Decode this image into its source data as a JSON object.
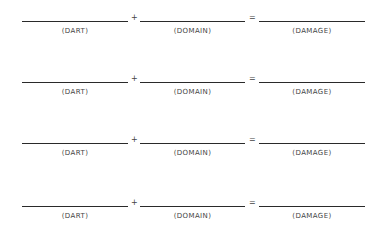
{
  "worksheet": {
    "rows": [
      {
        "term1_label": "(DART)",
        "operator1": "+",
        "term2_label": "(DOMAIN)",
        "operator2": "=",
        "result_label": "(DAMAGE)"
      },
      {
        "term1_label": "(DART)",
        "operator1": "+",
        "term2_label": "(DOMAIN)",
        "operator2": "=",
        "result_label": "(DAMAGE)"
      },
      {
        "term1_label": "(DART)",
        "operator1": "+",
        "term2_label": "(DOMAIN)",
        "operator2": "=",
        "result_label": "(DAMAGE)"
      },
      {
        "term1_label": "(DART)",
        "operator1": "+",
        "term2_label": "(DOMAIN)",
        "operator2": "=",
        "result_label": "(DAMAGE)"
      }
    ]
  }
}
